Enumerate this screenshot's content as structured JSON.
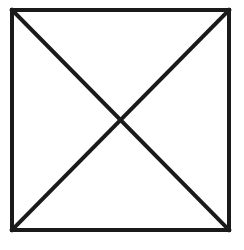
{
  "diagram": {
    "stroke_color": "#1a1a1a",
    "background": "#ffffff",
    "square": {
      "x": 12,
      "y": 10,
      "width": 217,
      "height": 220,
      "stroke_width": 4
    },
    "diagonals": [
      {
        "x1": 12,
        "y1": 10,
        "x2": 229,
        "y2": 230
      },
      {
        "x1": 229,
        "y1": 10,
        "x2": 12,
        "y2": 230
      }
    ]
  }
}
